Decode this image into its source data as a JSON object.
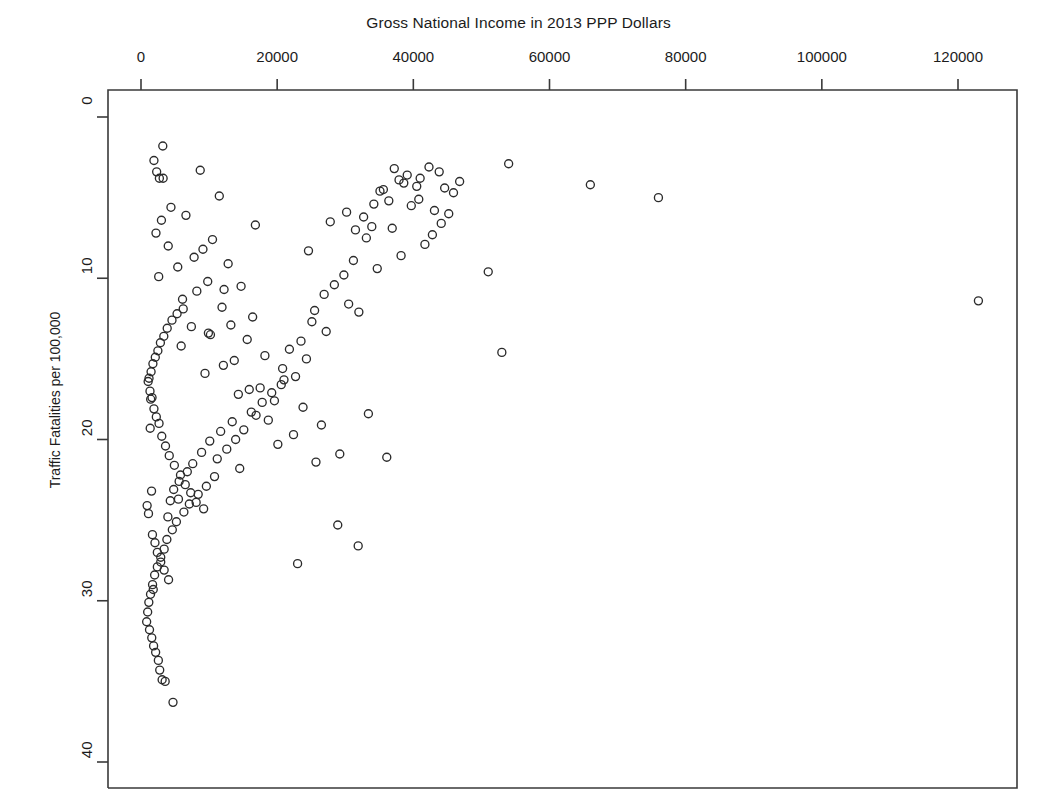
{
  "chart_data": {
    "type": "scatter",
    "title": "Gross National Income in 2013 PPP Dollars",
    "xlabel": "Gross National Income in 2013 PPP Dollars",
    "ylabel": "Traffic Fatalities per 100,000",
    "xlim": [
      -2500,
      128000
    ],
    "ylim": [
      0,
      41.6
    ],
    "y_axis_inverted": true,
    "x_axis_position": "top",
    "grid": false,
    "legend": null,
    "marker": "open-circle",
    "marker_color": "#2b2b2b",
    "xticks": [
      0,
      20000,
      40000,
      60000,
      80000,
      100000,
      120000
    ],
    "xtick_labels": [
      "0",
      "20000",
      "40000",
      "60000",
      "80000",
      "100000",
      "120000"
    ],
    "yticks": [
      0,
      10,
      20,
      30,
      40
    ],
    "ytick_labels": [
      "0",
      "10",
      "20",
      "30",
      "40"
    ],
    "x": [
      3200,
      1900,
      8700,
      11500,
      4400,
      3000,
      6600,
      2200,
      4000,
      10500,
      7800,
      9100,
      5400,
      2600,
      12800,
      9800,
      8200,
      6100,
      14700,
      11900,
      16400,
      13200,
      10200,
      7400,
      5900,
      18200,
      15600,
      12100,
      9400,
      21000,
      17500,
      14300,
      23800,
      19600,
      16900,
      26500,
      22400,
      20100,
      29200,
      25700,
      31500,
      27800,
      24600,
      33900,
      30200,
      36400,
      32700,
      35100,
      38600,
      34200,
      37900,
      40500,
      39100,
      42300,
      41000,
      43800,
      40800,
      44600,
      45900,
      43100,
      44100,
      45200,
      46800,
      42800,
      41700,
      38200,
      39700,
      36900,
      35600,
      33100,
      31200,
      34700,
      37200,
      29800,
      28400,
      26900,
      30500,
      32000,
      27200,
      25100,
      23500,
      21800,
      24300,
      22700,
      20600,
      19200,
      17800,
      16200,
      18700,
      15100,
      13900,
      12600,
      11200,
      14500,
      10800,
      9600,
      8400,
      7100,
      6300,
      5200,
      4600,
      3800,
      3400,
      2900,
      2400,
      2000,
      1700,
      1400,
      1150,
      980,
      830,
      1250,
      1580,
      1850,
      2150,
      2550,
      2750,
      3100,
      3550,
      3950,
      4300,
      4800,
      5600,
      6800,
      7600,
      8900,
      10100,
      11700,
      13400,
      15900,
      1050,
      1320,
      1620,
      1900,
      2250,
      2650,
      3050,
      3600,
      4150,
      4900,
      5800,
      6500,
      7300,
      8100,
      9200,
      1480,
      1750,
      2100,
      2480,
      2850,
      3350,
      3850,
      4550,
      5300,
      6200,
      1180,
      1420,
      1680,
      2050,
      2400,
      2900,
      3400,
      4050,
      4700,
      5500,
      900,
      1100,
      1350,
      1550,
      1800,
      2300,
      2700,
      3250,
      12200,
      20800,
      23000,
      25500,
      16800,
      13700,
      9900,
      54000,
      66000,
      76000,
      51000,
      123000,
      53000,
      33400,
      36100,
      28900,
      31900
    ],
    "y": [
      1.8,
      2.7,
      3.3,
      4.9,
      5.6,
      6.4,
      6.1,
      7.2,
      8.0,
      7.6,
      8.7,
      8.2,
      9.3,
      9.9,
      9.1,
      10.2,
      10.8,
      11.3,
      10.5,
      11.8,
      12.4,
      12.9,
      13.5,
      13.0,
      14.2,
      14.8,
      13.8,
      15.4,
      15.9,
      16.3,
      16.8,
      17.2,
      18.0,
      17.6,
      18.5,
      19.1,
      19.7,
      20.3,
      20.9,
      21.4,
      7.0,
      6.5,
      8.3,
      6.8,
      5.9,
      5.2,
      6.2,
      4.6,
      4.1,
      5.4,
      3.9,
      4.3,
      3.6,
      3.1,
      3.8,
      3.4,
      5.1,
      4.4,
      4.7,
      5.8,
      6.6,
      6.0,
      4.0,
      7.3,
      7.9,
      8.6,
      5.5,
      6.9,
      4.5,
      7.5,
      8.9,
      9.4,
      3.2,
      9.8,
      10.4,
      11.0,
      11.6,
      12.1,
      13.3,
      12.7,
      13.9,
      14.4,
      15.0,
      16.1,
      16.6,
      17.1,
      17.7,
      18.3,
      18.8,
      19.4,
      20.0,
      20.6,
      21.2,
      21.8,
      22.3,
      22.9,
      23.4,
      24.0,
      24.5,
      25.1,
      25.6,
      26.2,
      26.8,
      27.3,
      27.9,
      28.4,
      29.0,
      29.6,
      30.1,
      30.7,
      31.3,
      31.8,
      32.3,
      32.8,
      33.2,
      33.7,
      34.3,
      34.9,
      35.0,
      24.8,
      23.8,
      23.1,
      22.6,
      22.0,
      21.5,
      20.8,
      20.1,
      19.5,
      18.9,
      16.9,
      16.4,
      17.0,
      17.4,
      18.1,
      18.6,
      19.0,
      19.8,
      20.4,
      21.0,
      21.6,
      22.2,
      22.8,
      23.3,
      23.9,
      24.3,
      15.8,
      15.3,
      14.9,
      14.5,
      14.0,
      13.6,
      13.1,
      12.6,
      12.2,
      11.9,
      16.2,
      17.5,
      25.9,
      26.4,
      27.0,
      27.6,
      28.1,
      28.7,
      36.3,
      23.7,
      24.1,
      24.6,
      19.3,
      23.2,
      29.3,
      3.4,
      3.8,
      3.8,
      10.7,
      15.6,
      27.7,
      12.0,
      6.7,
      15.1,
      13.4,
      2.9,
      4.2,
      5.0,
      9.6,
      11.4,
      14.6,
      18.4,
      21.1,
      25.3,
      26.6
    ]
  }
}
